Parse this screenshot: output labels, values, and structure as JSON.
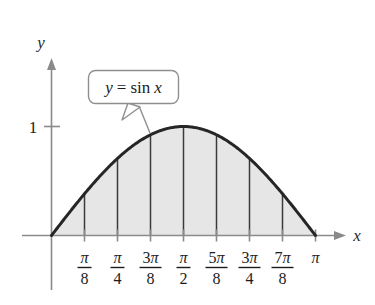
{
  "figure": {
    "type": "math-graph",
    "axes": {
      "x_label": "x",
      "y_label": "y"
    },
    "y_ticks": [
      {
        "label": "1",
        "value": 1
      }
    ],
    "callout": {
      "equation_lhs": "y",
      "equation_eq": "=",
      "equation_fn": "sin",
      "equation_arg": "x",
      "full_text": "y = sin x"
    },
    "colors": {
      "curve": "#262626",
      "axis": "#8a8a8a",
      "region_fill": "#e6e6e6",
      "partition_line": "#3a3a3a",
      "callout_border": "#8f8f8f",
      "callout_fill": "#ffffff",
      "text": "#1c1c1c"
    },
    "x_ticks": [
      {
        "id": "pi-over-8",
        "numerator": "π",
        "denominator": "8",
        "value": 0.3926990817
      },
      {
        "id": "pi-over-4",
        "numerator": "π",
        "denominator": "4",
        "value": 0.7853981634
      },
      {
        "id": "3pi-over-8",
        "numerator": "3π",
        "denominator": "8",
        "value": 1.1780972451
      },
      {
        "id": "pi-over-2",
        "numerator": "π",
        "denominator": "2",
        "value": 1.5707963268
      },
      {
        "id": "5pi-over-8",
        "numerator": "5π",
        "denominator": "8",
        "value": 1.9634954085
      },
      {
        "id": "3pi-over-4",
        "numerator": "3π",
        "denominator": "4",
        "value": 2.3561944902
      },
      {
        "id": "7pi-over-8",
        "numerator": "7π",
        "denominator": "8",
        "value": 2.7488935719
      },
      {
        "id": "pi",
        "numerator": "π",
        "denominator": "",
        "value": 3.1415926536
      }
    ]
  },
  "chart_data": {
    "type": "area",
    "title": "",
    "subtitle": "",
    "xlabel": "x",
    "ylabel": "y",
    "xlim": [
      0,
      3.1415926536
    ],
    "ylim": [
      0,
      1.15
    ],
    "grid": false,
    "legend": false,
    "annotations": [
      {
        "text": "y = sin x",
        "type": "callout",
        "points_to_x": 1.0799224746,
        "points_to_y": 0.8819212643
      }
    ],
    "xtick_labels": [
      "π/8",
      "π/4",
      "3π/8",
      "π/2",
      "5π/8",
      "3π/4",
      "7π/8",
      "π"
    ],
    "xtick_values": [
      0.3926990817,
      0.7853981634,
      1.1780972451,
      1.5707963268,
      1.9634954085,
      2.3561944902,
      2.7488935719,
      3.1415926536
    ],
    "ytick_labels": [
      "1"
    ],
    "ytick_values": [
      1
    ],
    "series": [
      {
        "name": "y = sin x",
        "type": "curve-with-shaded-region",
        "x": [
          0,
          0.3926990817,
          0.7853981634,
          1.1780972451,
          1.5707963268,
          1.9634954085,
          2.3561944902,
          2.7488935719,
          3.1415926536
        ],
        "values": [
          0,
          0.3826834324,
          0.7071067812,
          0.9238795325,
          1,
          0.9238795325,
          0.7071067812,
          0.3826834324,
          0
        ]
      }
    ],
    "partition": {
      "description": "Vertical ordinate lines at each eighth of pi dividing the shaded region under y = sin x",
      "n_subintervals": 8,
      "x": [
        0.3926990817,
        0.7853981634,
        1.1780972451,
        1.5707963268,
        1.9634954085,
        2.3561944902,
        2.7488935719
      ],
      "heights": [
        0.3826834324,
        0.7071067812,
        0.9238795325,
        1,
        0.9238795325,
        0.7071067812,
        0.3826834324
      ]
    }
  }
}
